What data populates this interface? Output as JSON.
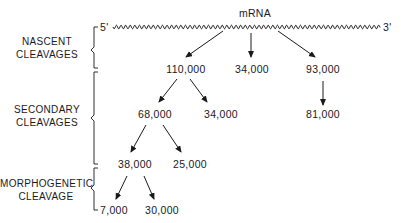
{
  "title": "mRNA",
  "five_prime": "5'",
  "three_prime": "3'",
  "sections": [
    {
      "line1": "NASCENT",
      "line2": "CLEAVAGES"
    },
    {
      "line1": "SECONDARY",
      "line2": "CLEAVAGES"
    },
    {
      "line1": "MORPHOGENETIC",
      "line2": "CLEAVAGE"
    }
  ],
  "nodes": {
    "n110": "110,000",
    "n34a": "34,000",
    "n93": "93,000",
    "n68": "68,000",
    "n34b": "34,000",
    "n81": "81,000",
    "n38": "38,000",
    "n25": "25,000",
    "n7": "7,000",
    "n30": "30,000"
  }
}
